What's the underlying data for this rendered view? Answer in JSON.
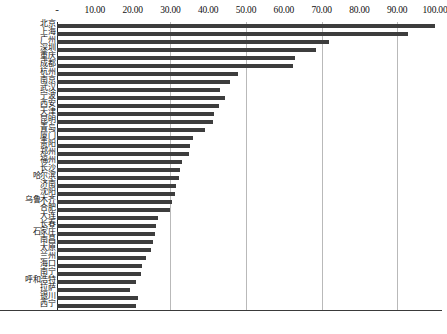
{
  "chart_data": {
    "type": "bar",
    "orientation": "horizontal",
    "title": "",
    "xlabel": "",
    "ylabel": "",
    "xlim": [
      0,
      100
    ],
    "grid": true,
    "gridlines": [
      30,
      50,
      70,
      90
    ],
    "legend": "none",
    "axis_tick_labels": [
      "-",
      "10.00",
      "20.00",
      "30.00",
      "40.00",
      "50.00",
      "60.00",
      "70.00",
      "80.00",
      "90.00",
      "100.00"
    ],
    "axis_tick_values": [
      0,
      10,
      20,
      30,
      40,
      50,
      60,
      70,
      80,
      90,
      100
    ],
    "categories": [
      "北京",
      "上海",
      "广州",
      "深圳",
      "重庆",
      "成都",
      "杭州",
      "南京",
      "武汉",
      "宁波",
      "西安",
      "天津",
      "昆明",
      "青岛",
      "厦门",
      "贵阳",
      "郑州",
      "福州",
      "长沙",
      "哈尔滨",
      "济南",
      "沈阳",
      "乌鲁木齐",
      "合肥",
      "大连",
      "长春",
      "石家庄",
      "南昌",
      "太原",
      "兰州",
      "海口",
      "南宁",
      "呼和浩特",
      "拉萨",
      "银川",
      "西宁"
    ],
    "values": [
      100.0,
      92.8,
      72.0,
      68.5,
      63.0,
      62.4,
      48.0,
      45.8,
      43.0,
      44.5,
      42.8,
      41.6,
      41.4,
      39.2,
      36.0,
      35.2,
      34.8,
      33.0,
      32.5,
      32.2,
      31.6,
      31.2,
      30.3,
      29.8,
      26.8,
      26.2,
      26.0,
      25.4,
      24.8,
      23.6,
      22.6,
      22.2,
      20.8,
      19.4,
      21.4,
      21.0
    ],
    "bar_color": "#3d3d3d",
    "gridline_color": "#b9b9b9",
    "axis_color": "#2b2b2b"
  }
}
